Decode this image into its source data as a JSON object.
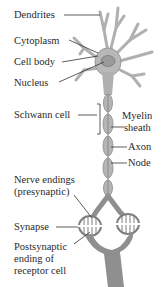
{
  "diagram": {
    "labels": {
      "dendrites": "Dendrites",
      "cytoplasm": "Cytoplasm",
      "cell_body": "Cell body",
      "nucleus": "Nucleus",
      "schwann_cell": "Schwann cell",
      "myelin_line1": "Myelin",
      "myelin_line2": "sheath",
      "axon": "Axon",
      "node": "Node",
      "nerve_endings_line1": "Nerve endings",
      "nerve_endings_line2": "(presynaptic)",
      "synapse": "Synapse",
      "postsynaptic_line1": "Postsynaptic",
      "postsynaptic_line2": "ending of",
      "postsynaptic_line3": "receptor cell"
    },
    "colors": {
      "neuron_fill": "#b8b8b8",
      "neuron_edge": "#8a8a8a",
      "nucleus_fill": "#9a9a9a",
      "receptor_fill": "#8f8f8f",
      "leader_line": "#333333",
      "text": "#2a2a2a"
    }
  }
}
